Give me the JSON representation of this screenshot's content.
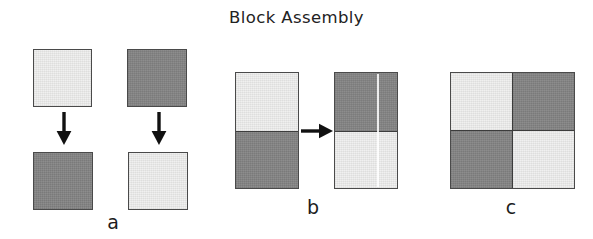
{
  "figure": {
    "title": "Block Assembly",
    "width": 593,
    "height": 239,
    "background": "#ffffff",
    "colors": {
      "light_block": "#f0f0ef",
      "dark_block": "#858585",
      "block_border": "#4a4a4a",
      "arrow": "#111111",
      "text": "#222222"
    }
  },
  "panels": [
    {
      "id": "a",
      "label": "a",
      "description": "Two single blocks, each with a downward arrow to its flipped counterpart",
      "blocks": [
        {
          "name": "top-left-block",
          "shade": "light"
        },
        {
          "name": "top-right-block",
          "shade": "dark"
        },
        {
          "name": "bottom-left-block",
          "shade": "dark"
        },
        {
          "name": "bottom-right-block",
          "shade": "light"
        }
      ],
      "arrows": [
        {
          "name": "arrow-down-left",
          "direction": "down"
        },
        {
          "name": "arrow-down-right",
          "direction": "down"
        }
      ]
    },
    {
      "id": "b",
      "label": "b",
      "description": "Two-block vertical stack transformed by a rightward arrow into its inverted stack",
      "left_stack": [
        {
          "name": "left-stack-top",
          "shade": "light"
        },
        {
          "name": "left-stack-bottom",
          "shade": "dark"
        }
      ],
      "right_stack": [
        {
          "name": "right-stack-top",
          "shade": "dark"
        },
        {
          "name": "right-stack-bottom",
          "shade": "light"
        }
      ],
      "arrows": [
        {
          "name": "arrow-right",
          "direction": "right"
        }
      ]
    },
    {
      "id": "c",
      "label": "c",
      "description": "Assembled two-by-two checkerboard of four blocks",
      "cells": [
        {
          "name": "grid-cell-top-left",
          "shade": "light"
        },
        {
          "name": "grid-cell-top-right",
          "shade": "dark"
        },
        {
          "name": "grid-cell-bottom-left",
          "shade": "dark"
        },
        {
          "name": "grid-cell-bottom-right",
          "shade": "light"
        }
      ]
    }
  ]
}
